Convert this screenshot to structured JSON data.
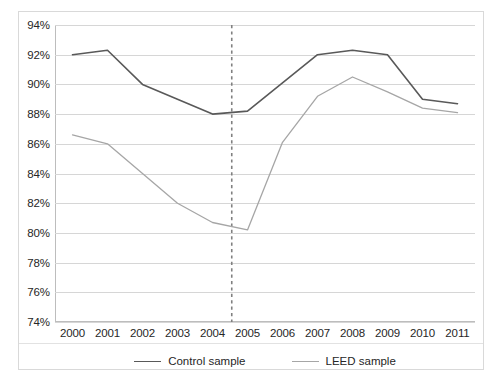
{
  "chart_data": {
    "type": "line",
    "title": "",
    "subtitle": "",
    "xlabel": "",
    "ylabel": "",
    "categories": [
      "2000",
      "2001",
      "2002",
      "2003",
      "2004",
      "2005",
      "2006",
      "2007",
      "2008",
      "2009",
      "2010",
      "2011"
    ],
    "x": [
      2000,
      2001,
      2002,
      2003,
      2004,
      2005,
      2006,
      2007,
      2008,
      2009,
      2010,
      2011
    ],
    "series": [
      {
        "name": "Control sample",
        "color": "#595959",
        "values": [
          92.0,
          92.3,
          90.0,
          89.0,
          88.0,
          88.2,
          90.1,
          92.0,
          92.3,
          92.0,
          89.0,
          88.7
        ]
      },
      {
        "name": "LEED sample",
        "color": "#a6a6a6",
        "values": [
          86.6,
          86.0,
          84.0,
          82.0,
          80.7,
          80.2,
          86.1,
          89.2,
          90.5,
          89.5,
          88.4,
          88.1
        ]
      }
    ],
    "ylim": [
      74,
      94
    ],
    "yticks": [
      74,
      76,
      78,
      80,
      82,
      84,
      86,
      88,
      90,
      92,
      94
    ],
    "ytick_labels": [
      "74%",
      "76%",
      "78%",
      "80%",
      "82%",
      "84%",
      "86%",
      "88%",
      "90%",
      "92%",
      "94%"
    ],
    "grid": true,
    "grid_axis": "y",
    "grid_color": "#d6d6d6",
    "legend_position": "bottom",
    "annotations": [
      {
        "type": "vertical-line",
        "name": "event-marker",
        "x_position": 2004.55,
        "style": "dashed",
        "color": "#808080",
        "label": ""
      }
    ]
  },
  "legend": {
    "entries": [
      {
        "label": "Control sample",
        "color": "#595959"
      },
      {
        "label": "LEED sample",
        "color": "#a6a6a6"
      }
    ]
  }
}
